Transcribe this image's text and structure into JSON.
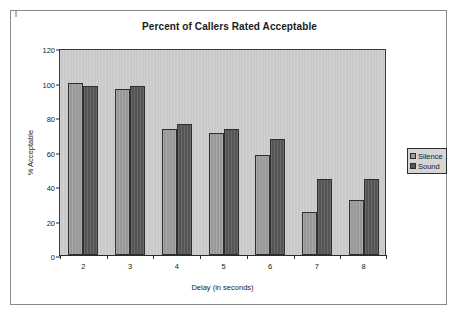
{
  "chart_data": {
    "type": "bar",
    "title": "Percent of Callers Rated Acceptable",
    "xlabel": "Delay (in seconds)",
    "ylabel": "% Acceptable",
    "categories": [
      "2",
      "3",
      "4",
      "5",
      "6",
      "7",
      "8"
    ],
    "series": [
      {
        "name": "Silence",
        "color": "#9b9b9b",
        "values": [
          100,
          96,
          73,
          71,
          58,
          25,
          32
        ]
      },
      {
        "name": "Sound",
        "color": "#585858",
        "values": [
          98,
          98,
          76,
          73,
          67,
          44,
          44
        ]
      }
    ],
    "ylim": [
      0,
      120
    ],
    "y_ticks": [
      "0",
      "20",
      "40",
      "60",
      "80",
      "100",
      "120"
    ],
    "grid": false,
    "legend_position": "right",
    "plot_background": "#c9c9c9"
  }
}
